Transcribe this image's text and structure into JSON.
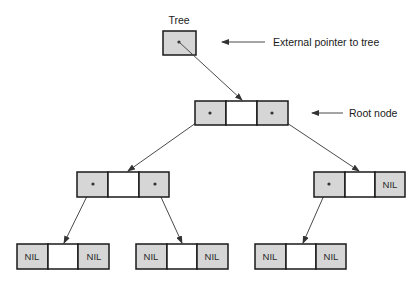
{
  "diagram": {
    "title_label": "Tree",
    "annotations": {
      "external_pointer": "External pointer to tree",
      "root_node": "Root node"
    },
    "nil_label": "NIL",
    "colors": {
      "pointer_cell": "#d6d6d6",
      "data_cell": "#ffffff",
      "border": "#1a1a1a",
      "edge": "#4a4a4a"
    },
    "nodes": [
      {
        "id": "root",
        "left": "pointer",
        "right": "pointer"
      },
      {
        "id": "level2-left",
        "left": "pointer",
        "right": "pointer"
      },
      {
        "id": "level2-right",
        "left": "pointer",
        "right": "NIL"
      },
      {
        "id": "leaf-1",
        "left": "NIL",
        "right": "NIL"
      },
      {
        "id": "leaf-2",
        "left": "NIL",
        "right": "NIL"
      },
      {
        "id": "leaf-3",
        "left": "NIL",
        "right": "NIL"
      }
    ]
  }
}
